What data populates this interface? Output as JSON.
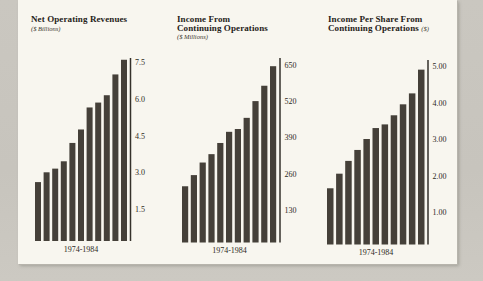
{
  "page": {
    "background_color": "#c8c5be",
    "paper_color": "#f8f6ef"
  },
  "colors": {
    "bar": "#454039",
    "axis": "#35312b",
    "text": "#262219"
  },
  "chart_data": [
    {
      "type": "bar",
      "title_line1": "Net Operating Revenues",
      "title_line2": "",
      "title_suffix": "",
      "unit_label": "($ Billions)",
      "xlabel": "1974-1984",
      "categories": [
        "1974",
        "1975",
        "1976",
        "1977",
        "1978",
        "1979",
        "1980",
        "1981",
        "1982",
        "1983",
        "1984"
      ],
      "values": [
        2.6,
        3.0,
        3.15,
        3.45,
        4.2,
        4.75,
        5.65,
        5.85,
        6.15,
        7.0,
        7.6
      ],
      "yticks": [
        1.5,
        3.0,
        4.5,
        6.0,
        7.5
      ],
      "ytick_labels": [
        "1.5",
        "3.0",
        "4.5",
        "6.0",
        "7.5"
      ],
      "ylim": [
        0,
        7.8
      ],
      "grid": false,
      "axis_side": "right"
    },
    {
      "type": "bar",
      "title_line1": "Income From",
      "title_line2": "Continuing Operations",
      "title_suffix": "",
      "unit_label": "($ Millions)",
      "xlabel": "1974-1984",
      "categories": [
        "1974",
        "1975",
        "1976",
        "1977",
        "1978",
        "1979",
        "1980",
        "1981",
        "1982",
        "1983",
        "1984"
      ],
      "values": [
        215,
        255,
        300,
        330,
        370,
        410,
        420,
        460,
        520,
        575,
        645
      ],
      "yticks": [
        130,
        260,
        390,
        520,
        650
      ],
      "ytick_labels": [
        "130",
        "260",
        "390",
        "520",
        "650"
      ],
      "ylim": [
        0,
        680
      ],
      "grid": false,
      "axis_side": "right"
    },
    {
      "type": "bar",
      "title_line1": "Income Per Share From",
      "title_line2": "Continuing Operations",
      "title_suffix": "($)",
      "unit_label": "",
      "xlabel": "1974-1984",
      "categories": [
        "1974",
        "1975",
        "1976",
        "1977",
        "1978",
        "1979",
        "1980",
        "1981",
        "1982",
        "1983",
        "1984"
      ],
      "values": [
        1.65,
        2.05,
        2.4,
        2.7,
        3.0,
        3.3,
        3.4,
        3.65,
        3.95,
        4.25,
        4.9
      ],
      "yticks": [
        1.0,
        2.0,
        3.0,
        4.0,
        5.0
      ],
      "ytick_labels": [
        "1.00",
        "2.00",
        "3.00",
        "4.00",
        "5.00"
      ],
      "ylim": [
        0,
        5.1
      ],
      "grid": false,
      "axis_side": "right"
    }
  ]
}
